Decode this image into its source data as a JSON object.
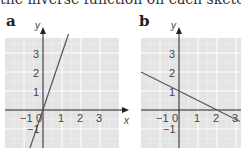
{
  "header": {
    "text": "the inverse function on each sketch."
  },
  "panels": [
    {
      "label": "a",
      "x_axis_label": "x",
      "y_axis_label": "y",
      "x_ticks": [
        "−1",
        "0",
        "1",
        "2",
        "3"
      ],
      "y_ticks": [
        "3",
        "2",
        "1",
        "−1"
      ],
      "line": {
        "equation": "y = 3x",
        "points": [
          [
            -0.67,
            -2
          ],
          [
            1.33,
            4
          ]
        ]
      }
    },
    {
      "label": "b",
      "x_axis_label": "x",
      "y_axis_label": "y",
      "x_ticks": [
        "−1",
        "0",
        "1",
        "2",
        "3"
      ],
      "y_ticks": [
        "3",
        "2",
        "1",
        "−1"
      ],
      "line": {
        "equation": "y = 1 − x/2",
        "points": [
          [
            -2,
            2
          ],
          [
            3.2,
            -0.6
          ]
        ]
      }
    }
  ],
  "colors": {
    "grid_bg": "#e6e6e6",
    "grid_line": "#ffffff",
    "axis": "#222222",
    "line": "#555555"
  }
}
